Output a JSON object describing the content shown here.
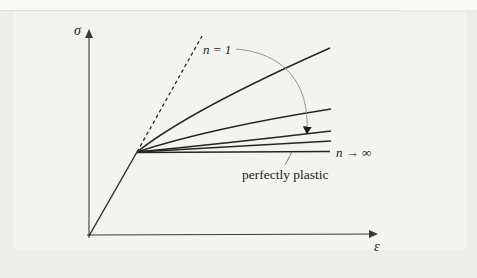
{
  "figure": {
    "title_hint": "stress-strain curves for power-law hardening exponents",
    "axis_labels": {
      "y": "σ",
      "x": "ε"
    },
    "annotations": {
      "n_equals_1": "n = 1",
      "n_to_infinity": "n → ∞",
      "perfectly_plastic": "perfectly plastic"
    },
    "colors": {
      "background": "#edeeea",
      "panel": "#f3f4f0",
      "curve": "#252525",
      "axis": "#3a3a3a",
      "arrow_arc": "#8a8a8a",
      "text": "#1c1c1c"
    },
    "paths": {
      "y_axis": "M 89 238 L 89 31",
      "x_axis": "M 87 235 L 376 234",
      "elastic_line": "M 89 236 L 137 152",
      "n1_dashed_line": "M 137 152 L 202 36",
      "curve_a": "M 137 152 Q 190 110 330 48",
      "curve_b": "M 137 152 Q 210 128 331 109",
      "curve_c": "M 137 152 Q 230 143 331 131",
      "curve_d": "M 137 152 Q 230 147 331 141",
      "perfectly_plastic_line": "M 137 152.5 L 330 151.5",
      "n_sweep_arc": "M 236 49 C 283 53 310 82 307 133",
      "perfectly_plastic_leader": "M 285 165 L 292 152"
    }
  }
}
